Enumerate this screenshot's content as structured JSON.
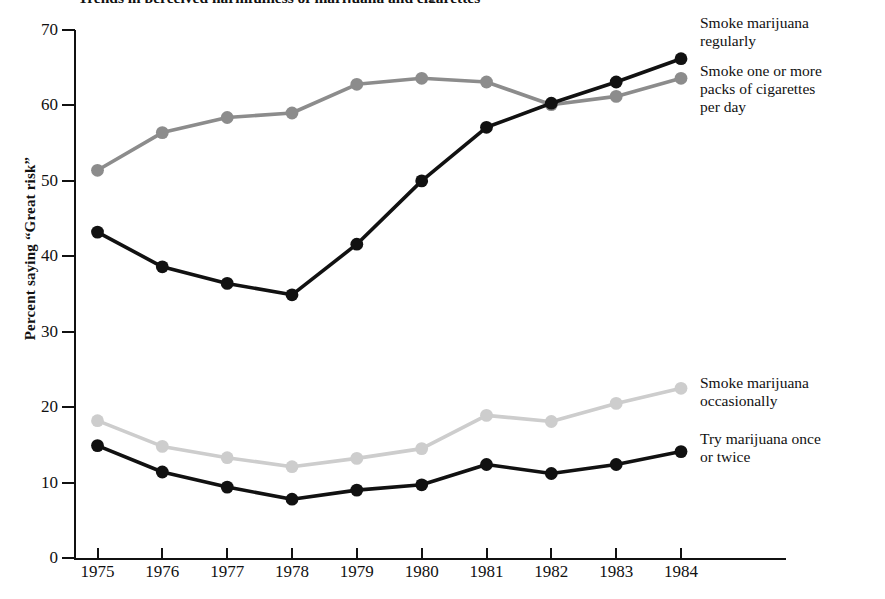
{
  "chart_data": {
    "type": "line",
    "title": "Trends in perceived harmfulness of marijuana and cigarettes",
    "xlabel": "",
    "ylabel": "Percent saying “Great risk”",
    "x": [
      1975,
      1976,
      1977,
      1978,
      1979,
      1980,
      1981,
      1982,
      1983,
      1984
    ],
    "categories": [
      "1975",
      "1976",
      "1977",
      "1978",
      "1979",
      "1980",
      "1981",
      "1982",
      "1983",
      "1984"
    ],
    "xlim": [
      1975,
      1984
    ],
    "ylim": [
      0,
      70
    ],
    "yticks": [
      0,
      10,
      20,
      30,
      40,
      50,
      60,
      70
    ],
    "grid": false,
    "legend_position": "right-direct-labels",
    "series": [
      {
        "name": "Smoke marijuana regularly",
        "color": "#111111",
        "marker": "circle",
        "values": [
          43.2,
          38.6,
          36.4,
          34.9,
          41.6,
          50.0,
          57.1,
          60.3,
          63.1,
          66.2
        ]
      },
      {
        "name": "Smoke one or more packs of cigarettes per day",
        "color": "#8c8c8c",
        "marker": "circle",
        "values": [
          51.4,
          56.4,
          58.4,
          59.0,
          62.8,
          63.6,
          63.1,
          60.1,
          61.2,
          63.6
        ]
      },
      {
        "name": "Smoke marijuana occasionally",
        "color": "#cdcdcd",
        "marker": "circle",
        "values": [
          18.2,
          14.8,
          13.3,
          12.1,
          13.2,
          14.5,
          18.9,
          18.1,
          20.5,
          22.5
        ]
      },
      {
        "name": "Try marijuana once or twice",
        "color": "#111111",
        "marker": "circle",
        "values": [
          14.9,
          11.4,
          9.4,
          7.8,
          9.0,
          9.7,
          12.4,
          11.2,
          12.4,
          14.1
        ]
      }
    ],
    "annotations": [
      {
        "id": "smoke-mj-regularly",
        "lines": [
          "Smoke marijuana",
          "regularly"
        ]
      },
      {
        "id": "smoke-cigs",
        "lines": [
          "Smoke one or more",
          "packs of cigarettes",
          "per day"
        ]
      },
      {
        "id": "smoke-mj-occasional",
        "lines": [
          "Smoke marijuana",
          "occasionally"
        ]
      },
      {
        "id": "try-mj",
        "lines": [
          "Try marijuana once",
          "or twice"
        ]
      }
    ]
  },
  "axis": {
    "ytick_labels": [
      "70",
      "60",
      "50",
      "40",
      "30",
      "20",
      "10",
      "0"
    ],
    "xtick_labels": [
      "1975",
      "1976",
      "1977",
      "1978",
      "1979",
      "1980",
      "1981",
      "1982",
      "1983",
      "1984"
    ],
    "ylabel": "Percent saying “Great risk”"
  },
  "legend": {
    "smoke_mj_regularly": "Smoke marijuana\nregularly",
    "smoke_cigs": "Smoke one or more\npacks of cigarettes\nper day",
    "smoke_mj_occasional": "Smoke marijuana\noccasionally",
    "try_mj": "Try marijuana once\nor twice"
  },
  "title": "Trends in perceived harmfulness of marijuana and cigarettes"
}
